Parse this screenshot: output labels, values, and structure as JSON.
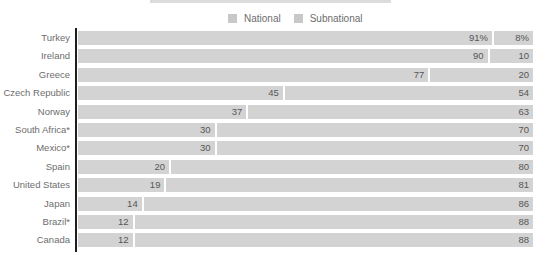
{
  "chart_data": {
    "type": "bar",
    "orientation": "horizontal",
    "stacked": true,
    "title": "",
    "xlim": [
      0,
      100
    ],
    "legend_position": "top-center",
    "grid": false,
    "categories": [
      "Turkey",
      "Ireland",
      "Greece",
      "Czech Republic",
      "Norway",
      "South Africa*",
      "Mexico*",
      "Spain",
      "United States",
      "Japan",
      "Brazil*",
      "Canada"
    ],
    "series": [
      {
        "name": "National",
        "values": [
          91,
          90,
          77,
          45,
          37,
          30,
          30,
          20,
          19,
          14,
          12,
          12
        ],
        "display_labels": [
          "91%",
          "90",
          "77",
          "45",
          "37",
          "30",
          "30",
          "20",
          "19",
          "14",
          "12",
          "12"
        ]
      },
      {
        "name": "Subnational",
        "values": [
          8,
          10,
          20,
          54,
          63,
          70,
          70,
          80,
          81,
          86,
          88,
          88
        ],
        "display_labels": [
          "8%",
          "10",
          "20",
          "54",
          "63",
          "70",
          "70",
          "80",
          "81",
          "86",
          "88",
          "88"
        ]
      }
    ],
    "colors": {
      "bar": "#d3d3d3",
      "legend_swatch": "#c8c8c8",
      "category_text": "#6d6d6d",
      "value_text": "#565656",
      "axis": "#1e1e1e",
      "divider": "#ffffff"
    }
  }
}
